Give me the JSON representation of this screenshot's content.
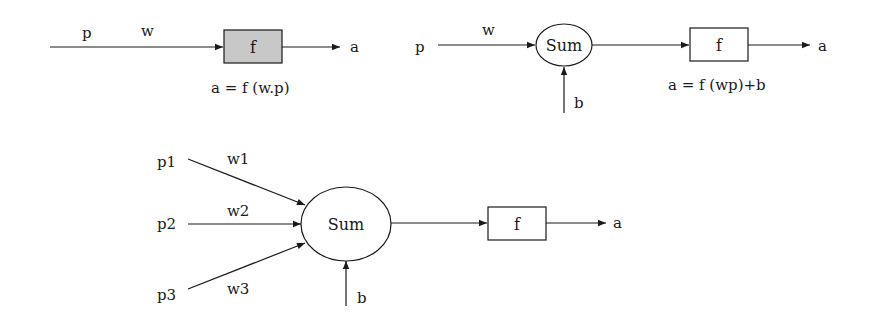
{
  "diagram_1": {
    "input_label": "p",
    "weight_label": "w",
    "function_label": "f",
    "output_label": "a",
    "equation": "a = f (w.p)",
    "function_box_fill": "#c8c8c8"
  },
  "diagram_2": {
    "input_label": "p",
    "weight_label": "w",
    "sum_label": "Sum",
    "bias_label": "b",
    "function_label": "f",
    "output_label": "a",
    "equation": "a = f (wp)+b"
  },
  "diagram_3": {
    "inputs": [
      {
        "input": "p1",
        "weight": "w1"
      },
      {
        "input": "p2",
        "weight": "w2"
      },
      {
        "input": "p3",
        "weight": "w3"
      }
    ],
    "sum_label": "Sum",
    "bias_label": "b",
    "function_label": "f",
    "output_label": "a"
  }
}
